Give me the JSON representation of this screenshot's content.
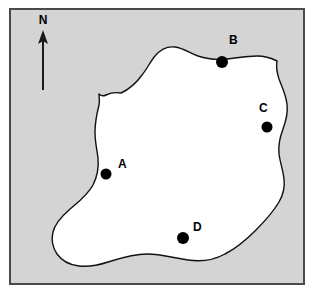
{
  "figure": {
    "background_color": "#ffffff",
    "sea_color": "#d4d4d4",
    "land_color": "#ffffff",
    "border_color": "#4a4a4a",
    "ink_color": "#000000"
  },
  "compass": {
    "label": "N",
    "direction": "north",
    "icon": "north-arrow-icon"
  },
  "sites": [
    {
      "id": "A",
      "label": "A",
      "cx": 95,
      "cy": 164,
      "r": 5.5,
      "label_x": 107,
      "label_y": 158
    },
    {
      "id": "B",
      "label": "B",
      "cx": 211,
      "cy": 52,
      "r": 6.0,
      "label_x": 218,
      "label_y": 34
    },
    {
      "id": "C",
      "label": "C",
      "cx": 256,
      "cy": 117,
      "r": 5.5,
      "label_x": 248,
      "label_y": 102
    },
    {
      "id": "D",
      "label": "D",
      "cx": 172,
      "cy": 228,
      "r": 6.0,
      "label_x": 182,
      "label_y": 221
    }
  ],
  "island": {
    "name": "island-outline",
    "path": "M 110 83 C 104 82 99 83 95 85 C 93 86 90 86 88 84 C 88 88 89 91 88 95 C 86 103 84 112 84 122 C 84 132 86 140 87 148 C 88 158 86 167 82 175 C 76 186 66 193 58 200 C 50 207 44 214 42 222 C 40 230 42 238 46 244 C 51 251 59 255 68 256 C 78 257 88 255 97 252 C 110 248 122 244 136 244 C 150 244 163 248 177 250 C 190 252 203 250 214 244 C 226 238 236 229 245 220 C 254 211 262 202 268 192 C 272 185 274 177 273 169 C 272 160 269 152 268 144 C 267 135 269 127 272 119 C 275 111 277 102 276 94 C 275 85 271 77 268 69 C 266 63 265 57 266 51 C 260 48 253 46 246 46 C 236 46 226 48 216 49 C 206 50 196 49 187 46 C 179 43 172 38 164 37 C 156 36 149 40 144 46 C 139 52 136 59 131 65 C 126 72 119 79 110 83 Z"
  }
}
